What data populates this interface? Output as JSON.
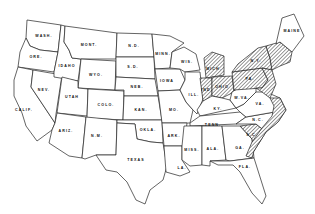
{
  "map": {
    "type": "outline map of the contiguous United States",
    "legend": "none visible",
    "hatch_color": "#333333",
    "line_color": "#222222",
    "background": "#ffffff",
    "shaded_region_description": "Diagonal hatching over Great Lakes / Northeast states and a coastal strip from Virginia through South Carolina into Georgia",
    "states": [
      {
        "id": "wa",
        "label": "WASH.",
        "shaded": false
      },
      {
        "id": "or",
        "label": "ORE.",
        "shaded": false
      },
      {
        "id": "ca",
        "label": "CALIF.",
        "shaded": false
      },
      {
        "id": "id",
        "label": "IDAHO",
        "shaded": false
      },
      {
        "id": "nv",
        "label": "NEV.",
        "shaded": false
      },
      {
        "id": "mt",
        "label": "MONT.",
        "shaded": false
      },
      {
        "id": "wy",
        "label": "WYO.",
        "shaded": false
      },
      {
        "id": "ut",
        "label": "UTAH",
        "shaded": false
      },
      {
        "id": "az",
        "label": "ARIZ.",
        "shaded": false
      },
      {
        "id": "co",
        "label": "COLO.",
        "shaded": false
      },
      {
        "id": "nm",
        "label": "N.M.",
        "shaded": false
      },
      {
        "id": "nd",
        "label": "N.D.",
        "shaded": false
      },
      {
        "id": "sd",
        "label": "S.D.",
        "shaded": false
      },
      {
        "id": "ne",
        "label": "NEB.",
        "shaded": false
      },
      {
        "id": "ks",
        "label": "KAN.",
        "shaded": false
      },
      {
        "id": "ok",
        "label": "OKLA.",
        "shaded": false
      },
      {
        "id": "tx",
        "label": "TEXAS",
        "shaded": false
      },
      {
        "id": "mn",
        "label": "MINN.",
        "shaded": false
      },
      {
        "id": "ia",
        "label": "IOWA",
        "shaded": false
      },
      {
        "id": "mo",
        "label": "MO.",
        "shaded": false
      },
      {
        "id": "ar",
        "label": "ARK.",
        "shaded": false
      },
      {
        "id": "la",
        "label": "LA.",
        "shaded": false
      },
      {
        "id": "wi",
        "label": "WIS.",
        "shaded": false
      },
      {
        "id": "il",
        "label": "ILL.",
        "shaded": false
      },
      {
        "id": "mi",
        "label": "MICH.",
        "shaded": true
      },
      {
        "id": "in",
        "label": "IND.",
        "shaded": true
      },
      {
        "id": "oh",
        "label": "OHIO",
        "shaded": true
      },
      {
        "id": "ky",
        "label": "KY.",
        "shaded": false
      },
      {
        "id": "tn",
        "label": "TENN.",
        "shaded": false
      },
      {
        "id": "ms",
        "label": "MISS.",
        "shaded": false
      },
      {
        "id": "al",
        "label": "ALA.",
        "shaded": false
      },
      {
        "id": "ga",
        "label": "GA.",
        "shaded": false
      },
      {
        "id": "fl",
        "label": "FLA.",
        "shaded": false
      },
      {
        "id": "sc",
        "label": "S.C.",
        "shaded": false
      },
      {
        "id": "nc",
        "label": "N.C.",
        "shaded": false
      },
      {
        "id": "va",
        "label": "VA.",
        "shaded": false
      },
      {
        "id": "wv",
        "label": "W.VA.",
        "shaded": false
      },
      {
        "id": "pa",
        "label": "PA.",
        "shaded": true
      },
      {
        "id": "ny",
        "label": "N.Y.",
        "shaded": true
      },
      {
        "id": "me",
        "label": "MAINE",
        "shaded": false
      }
    ]
  }
}
